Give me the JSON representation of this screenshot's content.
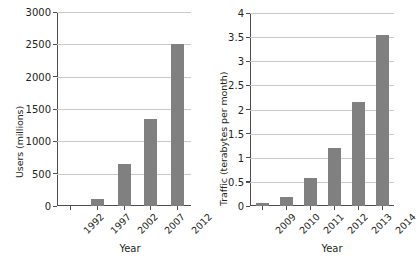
{
  "figure": {
    "background": "#ffffff",
    "bar_color": "#808080",
    "grid_color": "#c9c9c9",
    "axis_color": "#4d4d4d"
  },
  "chart_data": [
    {
      "type": "bar",
      "title": "",
      "xlabel": "Year",
      "ylabel": "Users (millions)",
      "categories": [
        "1992",
        "1997",
        "2002",
        "2007",
        "2012"
      ],
      "values": [
        0,
        110,
        650,
        1350,
        2500
      ],
      "ylim": [
        0,
        3000
      ],
      "yticks": [
        0,
        500,
        1000,
        1500,
        2000,
        2500,
        3000
      ],
      "ytick_labels": [
        "0",
        "500",
        "1000",
        "1500",
        "2000",
        "2500",
        "3000"
      ],
      "grid": true,
      "grid_axis": "y",
      "legend": "none",
      "xtick_rotation": 45
    },
    {
      "type": "bar",
      "title": "",
      "xlabel": "Year",
      "ylabel": "Traffic (terabytes per month)",
      "categories": [
        "2009",
        "2010",
        "2011",
        "2012",
        "2013",
        "2014"
      ],
      "values": [
        0.07,
        0.18,
        0.58,
        1.2,
        2.15,
        3.55
      ],
      "ylim": [
        0,
        4
      ],
      "yticks": [
        0,
        0.5,
        1,
        1.5,
        2,
        2.5,
        3,
        3.5,
        4
      ],
      "ytick_labels": [
        "0",
        "0.5",
        "1",
        "1.5",
        "2",
        "2.5",
        "3",
        "3.5",
        "4"
      ],
      "grid": true,
      "grid_axis": "y",
      "legend": "none",
      "xtick_rotation": 45
    }
  ]
}
